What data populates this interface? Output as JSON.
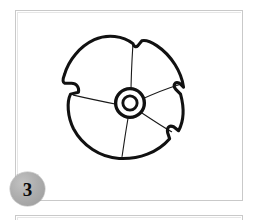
{
  "page": {
    "background_color": "#ffffff",
    "width": 254,
    "height": 220
  },
  "figure_panel": {
    "name": "figure-panel",
    "border_color": "#c9c9c9",
    "background_color": "#ffffff",
    "illustration": {
      "name": "rosette-flower-line-drawing",
      "description": "Hand-drawn black outline of a round five-petal rosette flower seen from above, with a double-ring circular hub at its centre and thin radial lines separating the petals.",
      "stroke_color": "#111111",
      "fill_color": "#ffffff",
      "petal_count": 5,
      "hub": {
        "name": "flower-center-hub",
        "outer_ring_color": "#111111",
        "inner_ring_color": "#111111",
        "core_fill": "#ffffff"
      }
    }
  },
  "step_badge": {
    "name": "step-badge",
    "label": "3",
    "fill_color": "#aeaeae",
    "text_color": "#0a0a0a"
  },
  "next_panel": {
    "name": "next-figure-panel",
    "border_color": "#c9c9c9",
    "background_color": "#ffffff"
  }
}
